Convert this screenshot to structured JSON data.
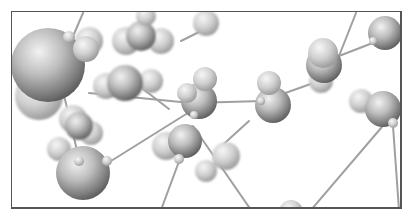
{
  "image": {
    "subject": "3D molecular ball-and-stick model",
    "palette": {
      "background": "#ffffff",
      "atom_light": "#e6e6e6",
      "atom_dark": "#6a6a6a",
      "bond": "#9a9a9a",
      "frame": "#555555"
    }
  }
}
